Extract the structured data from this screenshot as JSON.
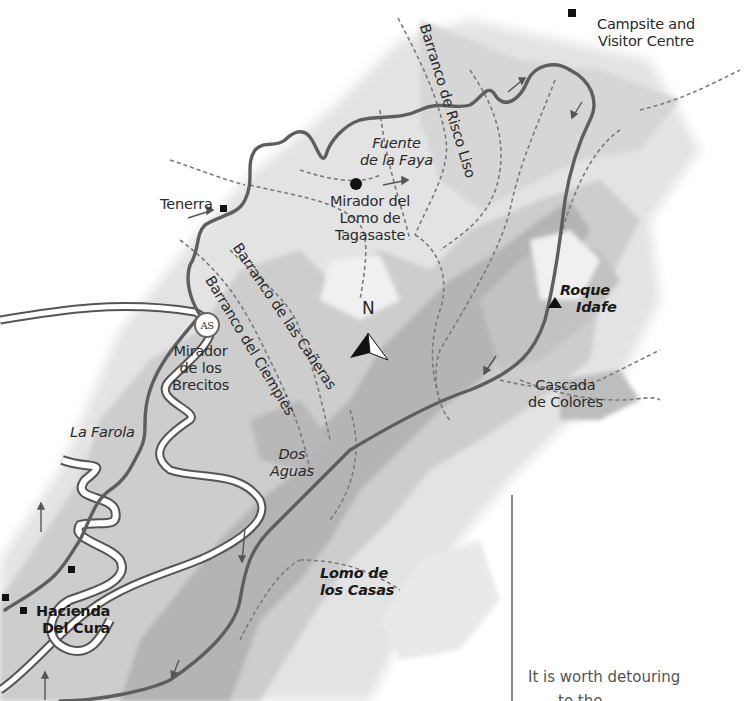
{
  "map": {
    "type": "hiking route map",
    "colors": {
      "background": "#ffffff",
      "terrain_light": "#e4e4e4",
      "terrain_mid": "#cfcfcf",
      "terrain_dark": "#b3b3b3",
      "route": "#5e5e5e",
      "paths_dashed": "#7a7a7a",
      "road_fill": "#ffffff"
    },
    "compass": {
      "label": "N"
    },
    "places": [
      {
        "id": "campsite",
        "lines": [
          "Campsite and",
          "Visitor Centre"
        ],
        "marker": "square"
      },
      {
        "id": "fuente",
        "lines": [
          "Fuente",
          "de la Faya"
        ],
        "style": "italic"
      },
      {
        "id": "mirador-lomo",
        "lines": [
          "Mirador del",
          "Lomo de",
          "Tagasaste"
        ],
        "marker": "dot"
      },
      {
        "id": "tenerra",
        "lines": [
          "Tenerra"
        ],
        "marker": "square"
      },
      {
        "id": "mirador-brecitos",
        "lines": [
          "Mirador",
          "de los",
          "Brecitos"
        ],
        "badge": "AS"
      },
      {
        "id": "roque",
        "lines": [
          "Roque",
          "Idafe"
        ],
        "style": "bold-italic",
        "marker": "triangle"
      },
      {
        "id": "cascada",
        "lines": [
          "Cascada",
          "de Colores"
        ]
      },
      {
        "id": "farola",
        "lines": [
          "La Farola"
        ],
        "style": "italic"
      },
      {
        "id": "dos-aguas",
        "lines": [
          "Dos",
          "Aguas"
        ],
        "style": "italic"
      },
      {
        "id": "lomo-casas",
        "lines": [
          "Lomo de",
          "los Casas"
        ],
        "style": "bold-italic"
      },
      {
        "id": "hacienda",
        "lines": [
          "Hacienda",
          "Del Cura"
        ],
        "style": "bold",
        "marker": "square"
      }
    ],
    "ravines": [
      {
        "id": "risco-liso",
        "label": "Barranco de Risco Liso"
      },
      {
        "id": "canas",
        "label": "Barranco de las Cañeras"
      },
      {
        "id": "ciempies",
        "label": "Barranco del Ciempies"
      }
    ],
    "badge_label": "AS"
  },
  "sidebar": {
    "text_line1": "It is worth detouring",
    "text_line2": "to the"
  }
}
